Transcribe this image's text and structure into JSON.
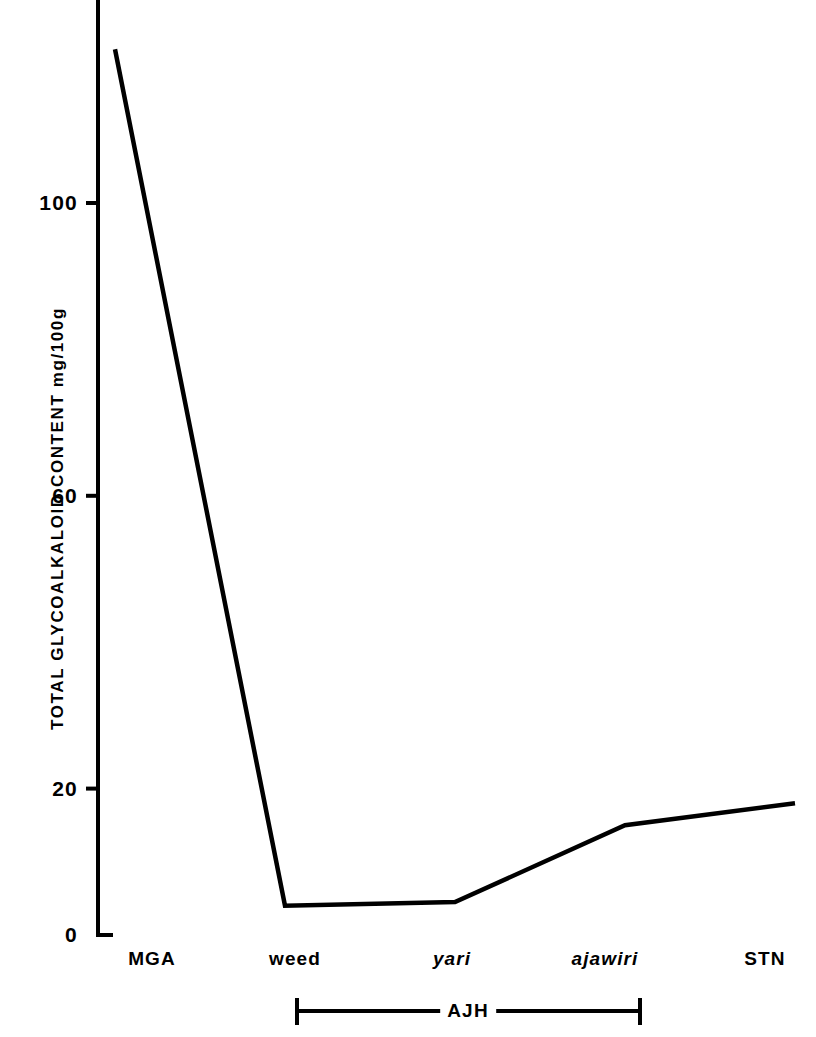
{
  "chart_data": {
    "type": "line",
    "title": "",
    "subtitle": "",
    "xlabel": "",
    "ylabel": "TOTAL GLYCOALKALOID CONTENT  mg/100g",
    "categories": [
      "MGA",
      "weed",
      "yari",
      "ajawiri",
      "STN"
    ],
    "values": [
      121,
      4,
      4.5,
      15,
      18
    ],
    "series": [
      {
        "name": "Total glycoalkaloid content",
        "values": [
          121,
          4,
          4.5,
          15,
          18
        ]
      }
    ],
    "ylim": [
      0,
      128
    ],
    "xlim": [
      0,
      4
    ],
    "ytick_labels": [
      "0",
      "20",
      "60",
      "100"
    ],
    "ytick_values": [
      0,
      20,
      60,
      100
    ],
    "grid": false,
    "legend": "none",
    "annotations": [
      {
        "text": "AJH",
        "type": "group-bracket",
        "spans": [
          "weed",
          "yari",
          "ajawiri"
        ]
      }
    ]
  },
  "axes": {
    "y_title": "TOTAL GLYCOALKALOID CONTENT  mg/100g",
    "y_ticks": [
      {
        "label": "100",
        "value": 100
      },
      {
        "label": "60",
        "value": 60
      },
      {
        "label": "20",
        "value": 20
      },
      {
        "label": "0",
        "value": 0
      }
    ],
    "x_ticks": [
      {
        "label": "MGA",
        "italic": false
      },
      {
        "label": "weed",
        "italic": false
      },
      {
        "label": "yari",
        "italic": true
      },
      {
        "label": "ajawiri",
        "italic": true
      },
      {
        "label": "STN",
        "italic": false
      }
    ]
  },
  "group_bracket": {
    "label": "AJH"
  },
  "style": {
    "line_color": "#000000",
    "axis_color": "#000000",
    "background": "#ffffff"
  }
}
